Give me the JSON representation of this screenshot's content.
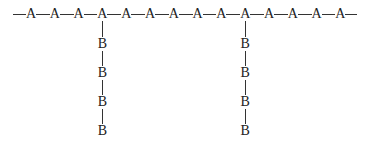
{
  "diagram": {
    "backbone": {
      "label": "A",
      "count": 14,
      "y": 14,
      "x_start": 31,
      "x_spacing": 23.8,
      "line_start_x": 13,
      "line_end_x": 357
    },
    "branches": [
      {
        "attach_index": 3,
        "label": "B",
        "count": 4
      },
      {
        "attach_index": 9,
        "label": "B",
        "count": 4
      }
    ],
    "branch_y": [
      44,
      73,
      102,
      131
    ],
    "colors": {
      "line": "#333333",
      "text": "#222222",
      "background": "#ffffff"
    }
  }
}
